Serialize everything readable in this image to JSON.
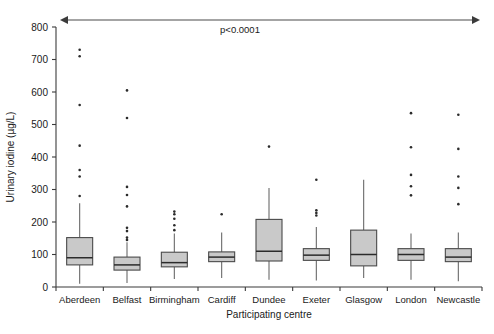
{
  "chart_data": {
    "type": "box",
    "title": "",
    "xlabel": "Participating centre",
    "ylabel": "Urinary iodine (µg/L)",
    "ylim": [
      0,
      800
    ],
    "yticks": [
      0,
      100,
      200,
      300,
      400,
      500,
      600,
      700,
      800
    ],
    "ytick_labels": [
      "0",
      "100",
      "200",
      "300",
      "400",
      "500",
      "600",
      "700",
      "800"
    ],
    "grid": false,
    "legend": "none",
    "annotations": [
      {
        "text": "p<0.0001",
        "kind": "double-headed-arrow-span",
        "spans_all_categories": true
      }
    ],
    "categories": [
      "Aberdeen",
      "Belfast",
      "Birmingham",
      "Cardiff",
      "Dundee",
      "Exeter",
      "Glasgow",
      "London",
      "Newcastle"
    ],
    "boxes": [
      {
        "category": "Aberdeen",
        "whisker_low": 10,
        "q1": 68,
        "median": 90,
        "q3": 152,
        "whisker_high": 258,
        "outliers": [
          730,
          710,
          560,
          435,
          360,
          340,
          280
        ]
      },
      {
        "category": "Belfast",
        "whisker_low": 12,
        "q1": 52,
        "median": 68,
        "q3": 92,
        "whisker_high": 138,
        "outliers": [
          605,
          520,
          308,
          283,
          248,
          182,
          172,
          152,
          145
        ]
      },
      {
        "category": "Birmingham",
        "whisker_low": 25,
        "q1": 62,
        "median": 75,
        "q3": 107,
        "whisker_high": 165,
        "outliers": [
          232,
          224,
          210,
          190,
          175
        ]
      },
      {
        "category": "Cardiff",
        "whisker_low": 28,
        "q1": 78,
        "median": 92,
        "q3": 108,
        "whisker_high": 168,
        "outliers": [
          224
        ]
      },
      {
        "category": "Dundee",
        "whisker_low": 22,
        "q1": 80,
        "median": 110,
        "q3": 208,
        "whisker_high": 305,
        "outliers": [
          432
        ]
      },
      {
        "category": "Exeter",
        "whisker_low": 20,
        "q1": 82,
        "median": 98,
        "q3": 118,
        "whisker_high": 185,
        "outliers": [
          330,
          236,
          228,
          220
        ]
      },
      {
        "category": "Glasgow",
        "whisker_low": 28,
        "q1": 65,
        "median": 100,
        "q3": 175,
        "whisker_high": 330,
        "outliers": []
      },
      {
        "category": "London",
        "whisker_low": 22,
        "q1": 82,
        "median": 100,
        "q3": 118,
        "whisker_high": 165,
        "outliers": [
          535,
          430,
          345,
          310,
          282
        ]
      },
      {
        "category": "Newcastle",
        "whisker_low": 18,
        "q1": 78,
        "median": 92,
        "q3": 118,
        "whisker_high": 168,
        "outliers": [
          530,
          425,
          340,
          305,
          255
        ]
      }
    ],
    "colors": {
      "box_fill": "#c9c9c9",
      "box_stroke": "#4a4a4a",
      "median": "#2b2b2b",
      "whisker": "#6a6a6a",
      "outlier": "#2b2b2b",
      "axis": "#3b3b3b",
      "text": "#1a1a1a"
    }
  }
}
